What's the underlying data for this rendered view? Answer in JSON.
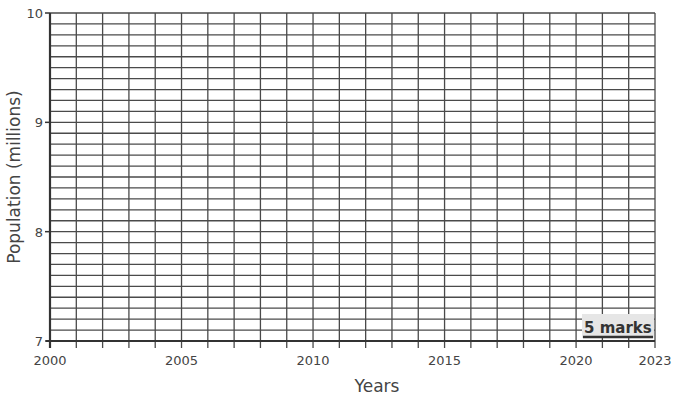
{
  "chart_data": {
    "type": "line",
    "title": "",
    "xlabel": "Years",
    "ylabel": "Population (millions)",
    "xlim": [
      2000,
      2023
    ],
    "ylim": [
      7,
      10
    ],
    "x_ticks": [
      2000,
      2005,
      2010,
      2015,
      2020,
      2023
    ],
    "x_tick_labels": [
      "2000",
      "2005",
      "2010",
      "2015",
      "2020",
      "2023"
    ],
    "y_ticks": [
      7,
      8,
      9,
      10
    ],
    "y_tick_labels": [
      "7",
      "8",
      "9",
      "10"
    ],
    "x_minor_step": 1,
    "y_minor_step": 0.1,
    "grid": true,
    "series": [],
    "annotations": [
      "5 marks"
    ]
  },
  "annotation": {
    "marks_label": "5 marks"
  },
  "colors": {
    "grid": "#4a4a4a",
    "axis": "#333333",
    "text": "#444444",
    "marks_bg": "#e6e6e6"
  }
}
